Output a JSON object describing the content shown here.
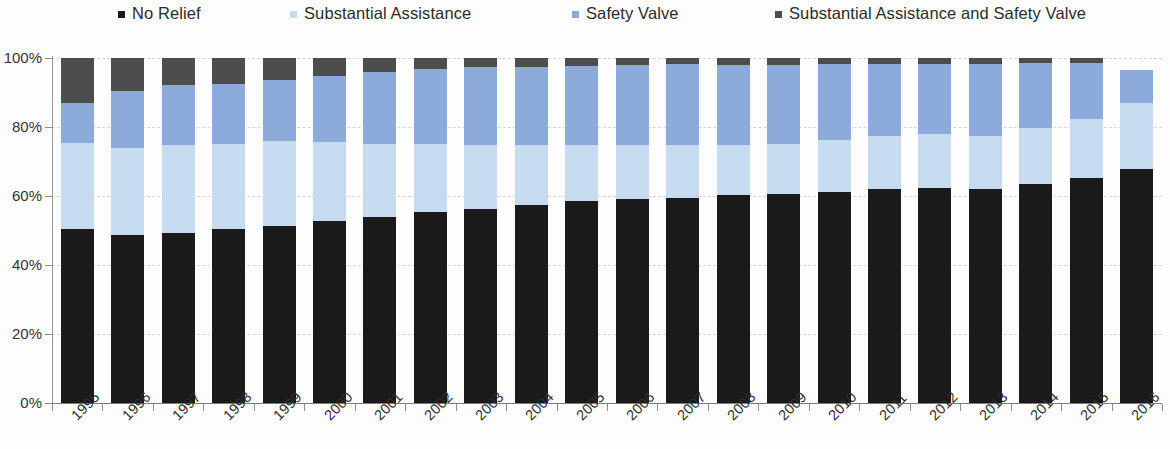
{
  "legend": {
    "items": [
      {
        "label": "No Relief",
        "color": "#1a1a1a",
        "x": 118
      },
      {
        "label": "Substantial Assistance",
        "color": "#c6daf0",
        "x": 290
      },
      {
        "label": "Safety Valve",
        "color": "#8cabdb",
        "x": 572
      },
      {
        "label": "Substantial Assistance and Safety Valve",
        "color": "#4d4d4d",
        "x": 775
      }
    ]
  },
  "axis": {
    "y_ticks": [
      "0%",
      "20%",
      "40%",
      "60%",
      "80%",
      "100%"
    ],
    "y_min": 0,
    "y_max": 100
  },
  "chart_data": {
    "type": "bar",
    "subtype": "stacked-bar-100-percent",
    "title": "",
    "xlabel": "",
    "ylabel": "",
    "ylim": [
      0,
      100
    ],
    "ytick_labels": [
      "0%",
      "20%",
      "40%",
      "60%",
      "80%",
      "100%"
    ],
    "grid": true,
    "legend_position": "top",
    "stack_order_bottom_to_top": [
      "No Relief",
      "Substantial Assistance",
      "Safety Valve",
      "Substantial Assistance and Safety Valve"
    ],
    "categories": [
      "1995",
      "1996",
      "1997",
      "1998",
      "1999",
      "2000",
      "2001",
      "2002",
      "2003",
      "2004",
      "2005",
      "2006",
      "2007",
      "2008",
      "2009",
      "2010",
      "2011",
      "2012",
      "2013",
      "2014",
      "2015",
      "2016"
    ],
    "series": [
      {
        "name": "No Relief",
        "color": "#1a1a1a",
        "values": [
          50.3,
          48.6,
          49.2,
          50.3,
          51.4,
          52.8,
          54.0,
          55.4,
          56.2,
          57.4,
          58.6,
          59.2,
          59.5,
          60.2,
          60.6,
          61.3,
          62.1,
          62.3,
          61.9,
          63.4,
          65.2,
          67.8
        ]
      },
      {
        "name": "Substantial Assistance",
        "color": "#c6daf0",
        "values": [
          25.2,
          25.4,
          25.6,
          24.7,
          24.6,
          23.0,
          21.0,
          19.6,
          18.6,
          17.5,
          16.2,
          15.5,
          15.3,
          14.7,
          14.5,
          14.9,
          15.2,
          15.6,
          15.5,
          16.4,
          17.0,
          19.2
        ]
      },
      {
        "name": "Safety Valve",
        "color": "#8cabdb",
        "values": [
          11.4,
          16.5,
          17.5,
          17.6,
          17.6,
          19.0,
          20.9,
          21.8,
          22.5,
          22.6,
          22.8,
          23.2,
          23.4,
          23.1,
          23.0,
          22.2,
          21.1,
          20.5,
          21.0,
          18.7,
          16.4,
          9.5
        ]
      },
      {
        "name": "Substantial Assistance and Safety Valve",
        "color": "#4d4d4d",
        "values": [
          13.1,
          9.5,
          7.7,
          7.4,
          6.4,
          5.2,
          4.1,
          3.2,
          2.7,
          2.5,
          2.4,
          2.1,
          1.8,
          2.0,
          1.9,
          1.6,
          1.6,
          1.6,
          1.6,
          1.5,
          1.4,
          0.0
        ]
      }
    ]
  }
}
